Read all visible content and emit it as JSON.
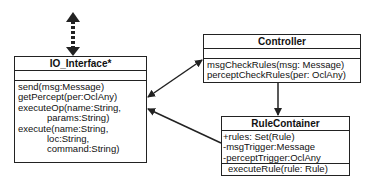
{
  "diagram": {
    "type": "UML class diagram",
    "classes": {
      "io_interface": {
        "name": "IO_Interface*",
        "attributes": [],
        "methods": [
          "send(msg:Message)",
          "getPercept(per:OclAny)",
          "executeOp(name:String,",
          "params:String)",
          "execute(name:String,",
          "loc:String,",
          "command:String)"
        ]
      },
      "controller": {
        "name": "Controller",
        "attributes": [],
        "methods": [
          "msgCheckRules(msg: Message)",
          "perceptCheckRules(per: OclAny)"
        ]
      },
      "rule_container": {
        "name": "RuleContainer",
        "attributes": [
          "+rules: Set(Rule)",
          "-msgTrigger:Message",
          "-perceptTrigger:OclAny"
        ],
        "methods": [
          "executeRule(rule: Rule)"
        ]
      }
    },
    "relations": [
      {
        "from": "external",
        "to": "IO_Interface*",
        "style": "dashed",
        "direction": "bidirectional"
      },
      {
        "from": "IO_Interface*",
        "to": "Controller",
        "style": "solid",
        "direction": "bidirectional"
      },
      {
        "from": "RuleContainer",
        "to": "IO_Interface*",
        "style": "solid",
        "direction": "unidirectional"
      },
      {
        "from": "Controller",
        "to": "RuleContainer",
        "style": "solid",
        "direction": "unidirectional"
      }
    ],
    "colors": {
      "line": "#222222",
      "background": "#ffffff"
    }
  }
}
